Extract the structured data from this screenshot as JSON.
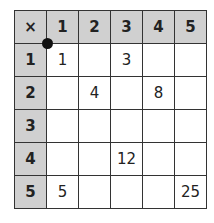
{
  "table": {
    "corner": "×",
    "col_headers": [
      "1",
      "2",
      "3",
      "4",
      "5"
    ],
    "rows": [
      {
        "header": "1",
        "cells": [
          "1",
          "",
          "3",
          "",
          ""
        ]
      },
      {
        "header": "2",
        "cells": [
          "",
          "4",
          "",
          "8",
          ""
        ]
      },
      {
        "header": "3",
        "cells": [
          "",
          "",
          "",
          "",
          ""
        ]
      },
      {
        "header": "4",
        "cells": [
          "",
          "",
          "12",
          "",
          ""
        ]
      },
      {
        "header": "5",
        "cells": [
          "5",
          "",
          "",
          "",
          "25"
        ]
      }
    ]
  },
  "colors": {
    "header_bg": "#d0d0d0",
    "border": "#333333",
    "dot": "#111111"
  }
}
